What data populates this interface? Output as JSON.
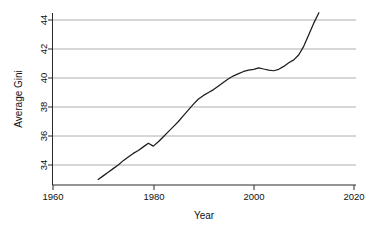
{
  "chart_data": {
    "type": "line",
    "title": "",
    "xlabel": "Year",
    "ylabel": "Average Gini",
    "xlim": [
      1958,
      2022
    ],
    "ylim": [
      32.6,
      44.8
    ],
    "xticks": [
      1960,
      1980,
      2000,
      2020
    ],
    "yticks": [
      34,
      36,
      38,
      40,
      42,
      44
    ],
    "grid": "horizontal",
    "legend": "none",
    "line_color": "#1d1d1d",
    "grid_color": "#9a9a9a",
    "axis_color": "#2a2a2a",
    "series": [
      {
        "name": "Average Gini",
        "x": [
          1969,
          1970,
          1971,
          1972,
          1973,
          1974,
          1975,
          1976,
          1977,
          1978,
          1979,
          1980,
          1981,
          1982,
          1983,
          1984,
          1985,
          1986,
          1987,
          1988,
          1989,
          1990,
          1991,
          1992,
          1993,
          1994,
          1995,
          1996,
          1997,
          1998,
          1999,
          2000,
          2001,
          2002,
          2003,
          2004,
          2005,
          2006,
          2007,
          2008,
          2009,
          2010,
          2011,
          2012,
          2013
        ],
        "values": [
          33.0,
          33.25,
          33.5,
          33.75,
          34.0,
          34.3,
          34.55,
          34.8,
          35.0,
          35.25,
          35.5,
          35.3,
          35.6,
          35.95,
          36.3,
          36.65,
          37.0,
          37.4,
          37.8,
          38.2,
          38.55,
          38.8,
          39.0,
          39.2,
          39.45,
          39.7,
          39.95,
          40.15,
          40.3,
          40.45,
          40.55,
          40.6,
          40.7,
          40.62,
          40.55,
          40.5,
          40.6,
          40.8,
          41.05,
          41.25,
          41.6,
          42.2,
          43.0,
          43.8,
          44.5
        ]
      }
    ],
    "annotations": [
      {
        "label": "series-start",
        "x": 1969,
        "y": 33.0
      },
      {
        "label": "plateau",
        "x": 2001,
        "y": 40.7
      },
      {
        "label": "series-end",
        "x": 2013,
        "y": 44.5
      }
    ]
  },
  "axes": {
    "y_tick_labels": [
      "34",
      "36",
      "38",
      "40",
      "42",
      "44"
    ],
    "x_tick_labels": [
      "1960",
      "1980",
      "2000",
      "2020"
    ],
    "x_axis_title": "Year",
    "y_axis_title": "Average Gini"
  }
}
